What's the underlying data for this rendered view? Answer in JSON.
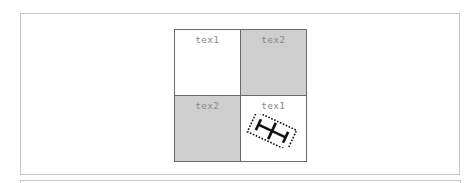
{
  "diagram": {
    "cells": [
      {
        "label": "tex1",
        "fill": "#ffffff",
        "row": 0,
        "col": 0
      },
      {
        "label": "tex2",
        "fill": "#cfcfcf",
        "row": 0,
        "col": 1
      },
      {
        "label": "tex2",
        "fill": "#cfcfcf",
        "row": 1,
        "col": 0
      },
      {
        "label": "tex1",
        "fill": "#ffffff",
        "row": 1,
        "col": 1
      }
    ],
    "marker": {
      "icon": "h-beam-icon",
      "rotation_deg": 25,
      "bounding_box_style": "dotted",
      "cell_index": 3
    },
    "colors": {
      "grid_line": "#6a6a6a",
      "frame_line": "#c8c8c8",
      "label_text": "#8a8a8a",
      "shaded_cell": "#cfcfcf",
      "marker": "#111111"
    }
  }
}
